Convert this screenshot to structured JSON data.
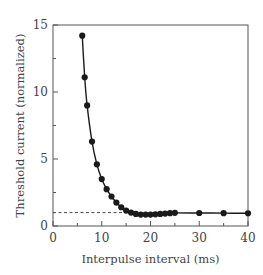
{
  "chart_data": {
    "type": "line",
    "title": "",
    "xlabel": "Interpulse interval (ms)",
    "ylabel": "Threshold current (normalized)",
    "xlim": [
      0,
      40
    ],
    "ylim": [
      0,
      15
    ],
    "xticks": [
      0,
      10,
      20,
      30,
      40
    ],
    "xtick_labels": [
      "0",
      "10",
      "20",
      "30",
      "40"
    ],
    "xminor": [
      5,
      15,
      25,
      35
    ],
    "yticks": [
      0,
      5,
      10,
      15
    ],
    "ytick_labels": [
      "0",
      "5",
      "10",
      "15"
    ],
    "yminor": [
      2.5,
      7.5,
      12.5
    ],
    "grid": false,
    "legend": null,
    "reference_line": {
      "y": 1.0,
      "x_from": 0,
      "x_to": 16,
      "style": "dashed"
    },
    "series": [
      {
        "name": "threshold",
        "marker": "filled-circle",
        "color": "#1a1a1a",
        "x": [
          6,
          6.5,
          7,
          8,
          9,
          10,
          11,
          12,
          13,
          14,
          15,
          16,
          17,
          18,
          19,
          20,
          21,
          22,
          23,
          24,
          25,
          30,
          35,
          40
        ],
        "y": [
          14.2,
          11.1,
          9.0,
          6.3,
          4.6,
          3.5,
          2.75,
          2.2,
          1.75,
          1.4,
          1.15,
          1.0,
          0.9,
          0.85,
          0.85,
          0.85,
          0.87,
          0.9,
          0.93,
          0.96,
          0.98,
          0.97,
          0.96,
          0.95
        ]
      }
    ]
  },
  "plot": {
    "left": 53,
    "right": 248,
    "top": 25,
    "bottom": 226
  }
}
